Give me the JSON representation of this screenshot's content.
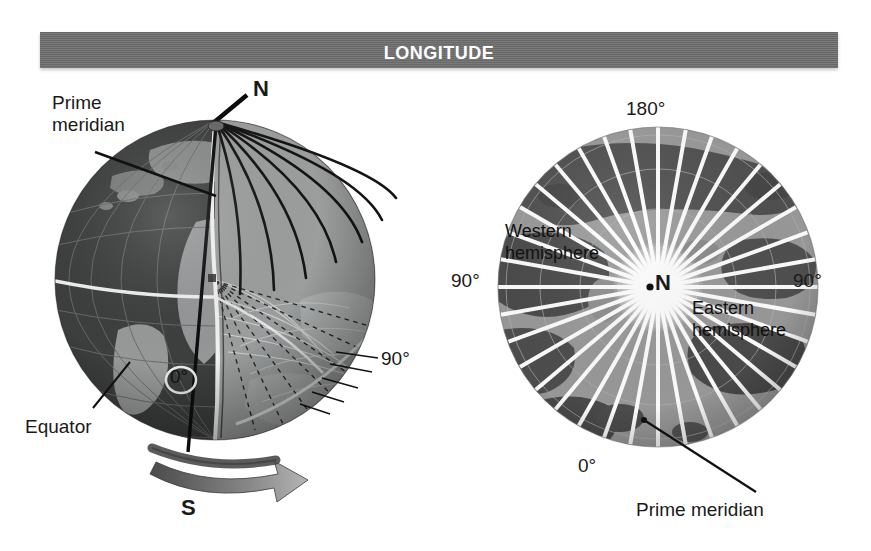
{
  "figure": {
    "title": "Longitude",
    "background_color": "#ffffff",
    "banner_color": "#6d6d6d",
    "banner_text_color": "#ffffff"
  },
  "left_globe": {
    "caption_prime_meridian": "Prime\nmeridian",
    "label_north_pole": "N",
    "label_south_pole": "S",
    "label_equator": "Equator",
    "label_zero_degrees": "0°",
    "label_ninety_degrees": "90°",
    "ocean_color": "#4a4a4a",
    "land_color": "#9b9b9b",
    "wedge_color": "#a8a8a8",
    "meridian_color": "#111111",
    "guide_color": "#f2f2f2"
  },
  "right_globe": {
    "label_180": "180°",
    "label_90_west": "90°",
    "label_90_east": "90°",
    "label_0": "0°",
    "label_pole": "N",
    "label_western_hemisphere": "Western\nhemisphere",
    "label_eastern_hemisphere": "Eastern\nhemisphere",
    "caption_prime_meridian": "Prime meridian",
    "ocean_color": "#9a9a9a",
    "land_color": "#4e4e4e",
    "meridian_color": "#ffffff",
    "meridian_count": 36
  }
}
